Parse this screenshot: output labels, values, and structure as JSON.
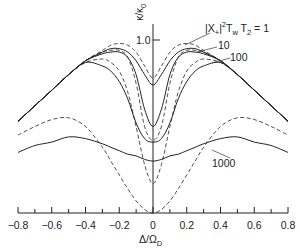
{
  "chart_data": {
    "type": "line",
    "title": "",
    "xlabel": "Δ/Ω_D",
    "ylabel": "κ/κ_0",
    "xlim": [
      -0.8,
      0.8
    ],
    "ylim": [
      0,
      1.05
    ],
    "xticks": [
      "-0.8",
      "-0.6",
      "-0.4",
      "-0.2",
      "0",
      "0.2",
      "0.4",
      "0.6",
      "0.8"
    ],
    "yticks": [
      "1.0"
    ],
    "grid": false,
    "legend": "inline annotations",
    "annotations": [
      {
        "text": "|X+|²TwT2 = 1",
        "target": "1"
      },
      {
        "text": "10",
        "target": "10"
      },
      {
        "text": "100",
        "target": "100"
      },
      {
        "text": "1000",
        "target": "1000"
      }
    ],
    "x": [
      -0.8,
      -0.7,
      -0.6,
      -0.5,
      -0.4,
      -0.3,
      -0.25,
      -0.2,
      -0.15,
      -0.1,
      -0.05,
      0,
      0.05,
      0.1,
      0.15,
      0.2,
      0.25,
      0.3,
      0.4,
      0.5,
      0.6,
      0.7,
      0.8
    ],
    "series": [
      {
        "name": "1 (solid)",
        "style": "solid",
        "values": [
          0.53,
          0.62,
          0.71,
          0.8,
          0.88,
          0.93,
          0.95,
          0.95,
          0.93,
          0.88,
          0.8,
          0.74,
          0.8,
          0.88,
          0.93,
          0.95,
          0.95,
          0.93,
          0.88,
          0.8,
          0.71,
          0.62,
          0.53
        ]
      },
      {
        "name": "1 (dashed)",
        "style": "dashed",
        "values": [
          0.53,
          0.62,
          0.71,
          0.8,
          0.88,
          0.94,
          0.97,
          0.98,
          0.97,
          0.93,
          0.85,
          0.78,
          0.85,
          0.93,
          0.97,
          0.98,
          0.97,
          0.94,
          0.88,
          0.8,
          0.71,
          0.62,
          0.53
        ]
      },
      {
        "name": "10 (solid)",
        "style": "solid",
        "values": [
          0.53,
          0.62,
          0.71,
          0.8,
          0.88,
          0.92,
          0.93,
          0.93,
          0.9,
          0.8,
          0.6,
          0.5,
          0.6,
          0.8,
          0.9,
          0.93,
          0.93,
          0.92,
          0.88,
          0.8,
          0.71,
          0.62,
          0.53
        ]
      },
      {
        "name": "10 (dashed)",
        "style": "dashed",
        "values": [
          0.53,
          0.62,
          0.71,
          0.8,
          0.88,
          0.93,
          0.94,
          0.94,
          0.9,
          0.75,
          0.5,
          0.42,
          0.5,
          0.75,
          0.9,
          0.94,
          0.94,
          0.93,
          0.88,
          0.8,
          0.71,
          0.62,
          0.53
        ]
      },
      {
        "name": "100 (solid)",
        "style": "solid",
        "values": [
          0.53,
          0.62,
          0.71,
          0.8,
          0.87,
          0.85,
          0.82,
          0.76,
          0.66,
          0.52,
          0.43,
          0.41,
          0.43,
          0.52,
          0.66,
          0.76,
          0.82,
          0.85,
          0.87,
          0.8,
          0.71,
          0.62,
          0.53
        ]
      },
      {
        "name": "100 (dashed)",
        "style": "dashed",
        "values": [
          0.53,
          0.62,
          0.71,
          0.8,
          0.87,
          0.89,
          0.87,
          0.82,
          0.7,
          0.5,
          0.28,
          0.17,
          0.28,
          0.5,
          0.7,
          0.82,
          0.87,
          0.89,
          0.87,
          0.8,
          0.71,
          0.62,
          0.53
        ]
      },
      {
        "name": "1000 (solid)",
        "style": "solid",
        "values": [
          0.35,
          0.39,
          0.41,
          0.44,
          0.43,
          0.4,
          0.38,
          0.36,
          0.34,
          0.33,
          0.31,
          0.3,
          0.31,
          0.33,
          0.34,
          0.36,
          0.38,
          0.4,
          0.43,
          0.44,
          0.41,
          0.39,
          0.35
        ]
      },
      {
        "name": "1000 (dashed)",
        "style": "dashed",
        "values": [
          0.45,
          0.5,
          0.54,
          0.55,
          0.5,
          0.38,
          0.3,
          0.22,
          0.14,
          0.07,
          0.02,
          0.0,
          0.02,
          0.07,
          0.14,
          0.22,
          0.3,
          0.38,
          0.5,
          0.55,
          0.54,
          0.5,
          0.45
        ]
      }
    ]
  },
  "labels": {
    "y_axis_label": "κ/κ",
    "y_axis_sub": "0",
    "y_tick": "1.0",
    "ann1_main": "|X",
    "ann1_sub1": "+",
    "ann1_mid": "|",
    "ann1_sup": "2",
    "ann1_t": "T",
    "ann1_sub2": "w",
    "ann1_t2": " T",
    "ann1_sub3": "2",
    "ann1_end": " = 1",
    "ann10": "10",
    "ann100": "100",
    "ann1000": "1000",
    "x_axis_label": "Δ/Ω",
    "x_axis_sub": "D"
  }
}
